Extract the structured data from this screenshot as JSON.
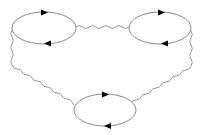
{
  "diagram": {
    "type": "feynman-diagram",
    "colors": {
      "line": "#8a8a8a",
      "arrow": "#000000",
      "background": "#ffffff"
    },
    "loops": [
      {
        "id": "top-left",
        "cx": 44,
        "cy": 28,
        "rx": 32,
        "ry": 16,
        "arrows": [
          "right-top",
          "left-bottom"
        ]
      },
      {
        "id": "top-right",
        "cx": 160,
        "cy": 28,
        "rx": 31,
        "ry": 16,
        "arrows": [
          "right-top",
          "left-bottom"
        ]
      },
      {
        "id": "bottom",
        "cx": 105,
        "cy": 110,
        "rx": 31,
        "ry": 16,
        "arrows": [
          "right-top",
          "left-bottom"
        ]
      }
    ],
    "propagators": [
      {
        "id": "top",
        "from": "top-left",
        "to": "top-right",
        "style": "wavy"
      },
      {
        "id": "left",
        "from": "top-left",
        "to": "bottom",
        "style": "wavy"
      },
      {
        "id": "right",
        "from": "top-right",
        "to": "bottom",
        "style": "wavy"
      }
    ]
  }
}
